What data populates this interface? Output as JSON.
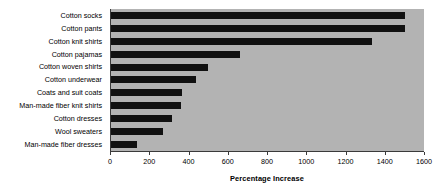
{
  "chart_data": {
    "type": "bar",
    "orientation": "horizontal",
    "title": "",
    "xlabel": "Percentage Increase",
    "ylabel": "",
    "xlim": [
      0,
      1600
    ],
    "xticks": [
      0,
      200,
      400,
      600,
      800,
      1000,
      1200,
      1400,
      1600
    ],
    "grid": false,
    "legend": false,
    "categories": [
      "Cotton socks",
      "Cotton pants",
      "Cotton knit shirts",
      "Cotton pajamas",
      "Cotton woven shirts",
      "Cotton underwear",
      "Coats and suit coats",
      "Man-made fiber knit shirts",
      "Cotton dresses",
      "Wool sweaters",
      "Man-made fiber dresses"
    ],
    "values": [
      1505,
      1503,
      1334,
      659,
      496,
      434,
      363,
      358,
      312,
      266,
      133
    ],
    "bar_color": "#111111",
    "plot_background": "#b3b3b3",
    "figure_background": "#ffffff"
  }
}
